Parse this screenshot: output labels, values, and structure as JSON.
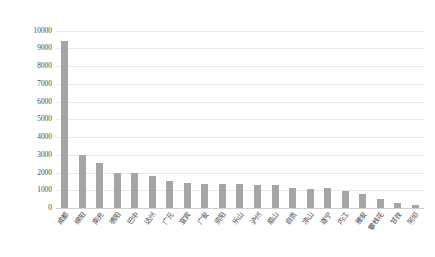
{
  "chart_data": {
    "type": "bar",
    "title": "",
    "xlabel": "",
    "ylabel": "",
    "ylim": [
      0,
      10000
    ],
    "ytick_step": 1000,
    "grid": true,
    "legend": "none",
    "bar_color": "#a5a5a5",
    "categories": [
      "成都",
      "绵阳",
      "南充",
      "德阳",
      "巴中",
      "达州",
      "广元",
      "宜宾",
      "广安",
      "资阳",
      "乐山",
      "泸州",
      "眉山",
      "自贡",
      "凉山",
      "遂宁",
      "内江",
      "雅安",
      "攀枝花",
      "甘孜",
      "阿坝"
    ],
    "values": [
      9400,
      3000,
      2550,
      2000,
      1950,
      1800,
      1550,
      1400,
      1380,
      1350,
      1330,
      1320,
      1300,
      1100,
      1080,
      1150,
      950,
      800,
      500,
      300,
      180
    ],
    "ytick_labels": [
      "10000",
      "9000",
      "8000",
      "7000",
      "6000",
      "5000",
      "4000",
      "3000",
      "2000",
      "1000",
      "0"
    ],
    "ytick_values": [
      10000,
      9000,
      8000,
      7000,
      6000,
      5000,
      4000,
      3000,
      2000,
      1000,
      0
    ]
  }
}
